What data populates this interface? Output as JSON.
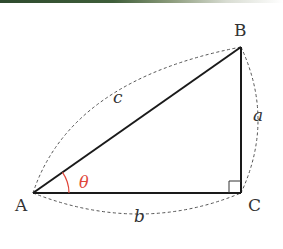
{
  "diagram": {
    "type": "right-triangle",
    "colors": {
      "edge": "#1a1a1a",
      "dashed": "#555555",
      "angle_arc": "#e0463a",
      "text": "#333333"
    },
    "vertices": {
      "A": {
        "label": "A",
        "x": 33,
        "y": 193
      },
      "B": {
        "label": "B",
        "x": 241,
        "y": 47
      },
      "C": {
        "label": "C",
        "x": 241,
        "y": 193
      }
    },
    "sides": {
      "hypotenuse": {
        "label": "c",
        "from": "A",
        "to": "B"
      },
      "vertical": {
        "label": "a",
        "from": "B",
        "to": "C"
      },
      "base": {
        "label": "b",
        "from": "A",
        "to": "C"
      }
    },
    "angle": {
      "label": "θ",
      "at": "A"
    },
    "right_angle_marker": {
      "at": "C"
    }
  }
}
